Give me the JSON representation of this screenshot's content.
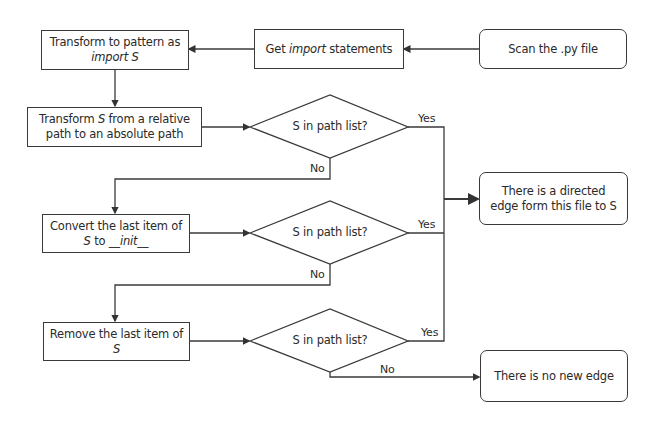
{
  "nodes": {
    "scan": {
      "text": "Scan the .py file"
    },
    "get_import": {
      "pre": "Get ",
      "italic": "import",
      "post": " statements"
    },
    "transform_pattern": {
      "line1": "Transform to pattern as",
      "line2_italic": "import S"
    },
    "transform_abs": {
      "line1_italic": "S",
      "line1": " from a relative",
      "pre": "Transform ",
      "line2": "path to an absolute path"
    },
    "convert_init": {
      "line1": "Convert the last item of",
      "line2_italic_s": "S",
      "line2_mid": " to ",
      "line2_italic": "__init__"
    },
    "remove_last": {
      "line1": "Remove the last item of",
      "line2_italic": "S"
    },
    "decision1": {
      "text": "S in path list?"
    },
    "decision2": {
      "text": "S in path list?"
    },
    "decision3": {
      "text": "S in path list?"
    },
    "result_edge": {
      "line1": "There is a directed",
      "line2": "edge form this file to S"
    },
    "result_no_edge": {
      "text": "There is no new edge"
    }
  },
  "edge_labels": {
    "yes1": "Yes",
    "no1": "No",
    "yes2": "Yes",
    "no2": "No",
    "yes3": "Yes",
    "no3": "No"
  },
  "colors": {
    "stroke": "#3a3a3a",
    "background": "#ffffff",
    "text": "#2a2a2a"
  }
}
